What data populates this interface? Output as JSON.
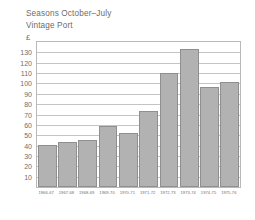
{
  "header": {
    "line1": "Seasons October–July",
    "line2": "Vintage Port"
  },
  "chart_data": {
    "type": "bar",
    "title": "Seasons October–July Vintage Port",
    "subtitle": "Vintage Port",
    "xlabel": "",
    "ylabel": "£",
    "unit_symbol": "£",
    "ylim": [
      0,
      140
    ],
    "grid": true,
    "legend": "none",
    "yticks": [
      130,
      120,
      110,
      100,
      90,
      80,
      70,
      60,
      50,
      40,
      30,
      20,
      10
    ],
    "ytick_labels": [
      "130",
      "120",
      "110",
      "100",
      "90",
      "80",
      "70",
      "60",
      "50",
      "40",
      "30",
      "20",
      "10"
    ],
    "categories": [
      "1966-67",
      "1967-68",
      "1968-69",
      "1969-70",
      "1970-71",
      "1971-72",
      "1972-73",
      "1973-74",
      "1974-75",
      "1975-76"
    ],
    "values": [
      41,
      43,
      45,
      59,
      52,
      73,
      110,
      133,
      97,
      101
    ],
    "bar_color": "#b2b2b2",
    "bar_edge_color": "#8f8f8f",
    "grid_color": "#c4c4c4",
    "frame_color": "#b9b9b9",
    "text_color": "#6e6e6e"
  }
}
